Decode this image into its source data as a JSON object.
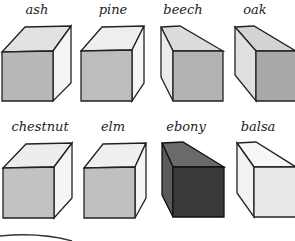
{
  "samples": [
    {
      "name": "ash",
      "front": "#b8b8b8",
      "top": "#e2e2e2",
      "side": "#f4f4f4",
      "orientation": "right"
    },
    {
      "name": "pine",
      "front": "#bdbdbd",
      "top": "#eeeeee",
      "side": "#f6f6f6",
      "orientation": "right"
    },
    {
      "name": "beech",
      "front": "#b3b3b3",
      "top": "#dcdcdc",
      "side": "#ececec",
      "orientation": "left"
    },
    {
      "name": "oak",
      "front": "#a9a9a9",
      "top": "#d3d3d3",
      "side": "#dfdfdf",
      "orientation": "left"
    },
    {
      "name": "chestnut",
      "front": "#c2c2c2",
      "top": "#ededed",
      "side": "#f5f5f5",
      "orientation": "right"
    },
    {
      "name": "elm",
      "front": "#c0c0c0",
      "top": "#efefef",
      "side": "#f5f5f5",
      "orientation": "right"
    },
    {
      "name": "ebony",
      "front": "#3a3a3a",
      "top": "#6a6a6a",
      "side": "#5a5a5a",
      "orientation": "left"
    },
    {
      "name": "balsa",
      "front": "#e8e8e8",
      "top": "#f7f7f7",
      "side": "#f3f3f3",
      "orientation": "left"
    }
  ]
}
